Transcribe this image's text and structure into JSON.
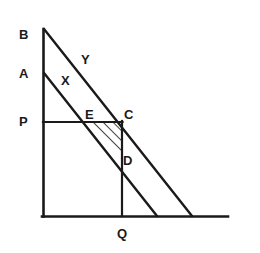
{
  "figure": {
    "type": "line-diagram",
    "width": 260,
    "height": 253,
    "background_color": "#ffffff",
    "stroke_color": "#1a1a1a"
  },
  "axes": {
    "origin": {
      "x": 43,
      "y": 216
    },
    "vertical": {
      "x": 43,
      "y_top": 29,
      "y_bottom": 216
    },
    "horizontal": {
      "y": 216,
      "x_left": 43,
      "x_right": 228
    }
  },
  "lines": [
    {
      "name": "line-Y",
      "label": "Y",
      "from": {
        "x": 43,
        "y": 29
      },
      "to": {
        "x": 192,
        "y": 216
      },
      "from_point": "B"
    },
    {
      "name": "line-X",
      "label": "X",
      "from": {
        "x": 43,
        "y": 73
      },
      "to": {
        "x": 157,
        "y": 216
      },
      "from_point": "A"
    }
  ],
  "construction": {
    "horizontal_segment": {
      "y": 122,
      "x_left": 43,
      "x_right": 122
    },
    "vertical_segment": {
      "x": 122,
      "y_top": 122,
      "y_bottom": 216
    }
  },
  "shaded_region": {
    "name": "triangle-ECD",
    "vertices": [
      "E",
      "C",
      "D"
    ],
    "fill": "hatch",
    "hatch_direction": "lower-left-to-upper-right",
    "points": [
      {
        "x": 90,
        "y": 122
      },
      {
        "x": 122,
        "y": 122
      },
      {
        "x": 122,
        "y": 160
      }
    ]
  },
  "labels": [
    {
      "id": "B",
      "text": "B",
      "x": 19,
      "y": 28,
      "anchor": "axis-top",
      "note": "top of vertical axis, start of line Y"
    },
    {
      "id": "A",
      "text": "A",
      "x": 19,
      "y": 67,
      "anchor": "axis",
      "note": "start of line X on vertical axis"
    },
    {
      "id": "P",
      "text": "P",
      "x": 19,
      "y": 115,
      "anchor": "axis",
      "note": "left end of horizontal construction segment"
    },
    {
      "id": "Y",
      "text": "Y",
      "x": 81,
      "y": 53,
      "anchor": "line",
      "note": "label for upper line"
    },
    {
      "id": "X",
      "text": "X",
      "x": 61,
      "y": 74,
      "anchor": "line",
      "note": "label for lower line"
    },
    {
      "id": "E",
      "text": "E",
      "x": 85,
      "y": 108,
      "anchor": "intersection",
      "note": "line X meets horizontal segment"
    },
    {
      "id": "C",
      "text": "C",
      "x": 124,
      "y": 108,
      "anchor": "intersection",
      "note": "line Y meets horizontal segment"
    },
    {
      "id": "D",
      "text": "D",
      "x": 123,
      "y": 154,
      "anchor": "intersection",
      "note": "line X meets vertical segment"
    },
    {
      "id": "Q",
      "text": "Q",
      "x": 117,
      "y": 227,
      "anchor": "axis",
      "note": "foot of vertical segment on horizontal axis"
    }
  ]
}
